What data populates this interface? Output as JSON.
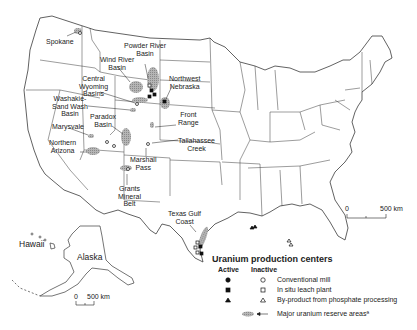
{
  "map": {
    "region_labels": {
      "hawaii": "Hawaii",
      "alaska": "Alaska"
    },
    "site_labels": [
      {
        "id": "spokane",
        "text": "Spokane"
      },
      {
        "id": "powder-river",
        "text": "Powder River\nBasin"
      },
      {
        "id": "wind-river",
        "text": "Wind River\nBasin"
      },
      {
        "id": "central-wyoming",
        "text": "Central\nWyoming\nBasins"
      },
      {
        "id": "northwest-nebraska",
        "text": "Northwest\nNebraska"
      },
      {
        "id": "washakie",
        "text": "Washakie-\nSand Wash\nBasin"
      },
      {
        "id": "paradox",
        "text": "Paradox\nBasin"
      },
      {
        "id": "front-range",
        "text": "Front\nRange"
      },
      {
        "id": "marysvale",
        "text": "Marysvale"
      },
      {
        "id": "tallahassee-creek",
        "text": "Tallahassee\nCreek"
      },
      {
        "id": "northern-arizona",
        "text": "Northern\nArizona"
      },
      {
        "id": "marshall-pass",
        "text": "Marshall\nPass"
      },
      {
        "id": "grants",
        "text": "Grants\nMineral\nBelt"
      },
      {
        "id": "texas-gulf",
        "text": "Texas Gulf\nCoast"
      }
    ],
    "scale_bars": [
      {
        "id": "main",
        "start": "0",
        "end": "500 km"
      },
      {
        "id": "alaska",
        "start": "0",
        "end": "500 km"
      }
    ]
  },
  "legend": {
    "title": "Uranium production centers",
    "active_header": "Active",
    "inactive_header": "Inactive",
    "rows": [
      {
        "active_symbol": "filled-circle",
        "inactive_symbol": "open-circle",
        "label": "Conventional mill"
      },
      {
        "active_symbol": "filled-square",
        "inactive_symbol": "open-square",
        "label": "In situ leach plant"
      },
      {
        "active_symbol": "filled-triangle",
        "inactive_symbol": "open-triangle",
        "label": "By-product from phosphate processing"
      }
    ],
    "reserve_label": "Major uranium reserve areasª"
  },
  "colors": {
    "outline": "#3a3a3a",
    "reserve_fill": "#9a9a9a",
    "marker": "#111111",
    "background": "#ffffff"
  }
}
